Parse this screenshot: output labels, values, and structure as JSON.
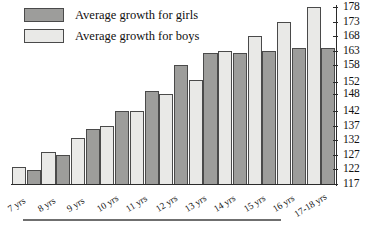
{
  "legend": {
    "position": "top-left",
    "entries": [
      {
        "label": "Average growth for girls",
        "key": "girls",
        "color": "#9d9d9b"
      },
      {
        "label": "Average growth for boys",
        "key": "boys",
        "color": "#e9e9e7"
      }
    ]
  },
  "axis": {
    "y_ticks": [
      "178",
      "173",
      "168",
      "163",
      "158",
      "152",
      "148",
      "142",
      "137",
      "132",
      "127",
      "122",
      "117"
    ],
    "y_min": 117,
    "y_max": 178
  },
  "chart_data": {
    "type": "bar",
    "title": "",
    "subtitle": "",
    "xlabel": "",
    "ylabel": "",
    "ylim": [
      117,
      178
    ],
    "grid": false,
    "legend_position": "top-left",
    "categories": [
      "7 yrs",
      "8 yrs",
      "9 yrs",
      "10 yrs",
      "11 yrs",
      "12 yrs",
      "13 yrs",
      "14 yrs",
      "15 yrs",
      "16 yrs",
      "17-18 yrs"
    ],
    "series": [
      {
        "name": "Average growth for boys",
        "color": "#e9e9e7",
        "values": [
          123,
          128,
          133,
          137,
          142,
          148,
          153,
          163,
          168,
          173,
          178
        ]
      },
      {
        "name": "Average growth for girls",
        "color": "#9d9d9b",
        "values": [
          122,
          127,
          136,
          142,
          149,
          158,
          162,
          162,
          163,
          164,
          164
        ]
      }
    ],
    "series_order_in_group": [
      "boys",
      "girls"
    ],
    "y_tick_labels": [
      "117",
      "122",
      "127",
      "132",
      "137",
      "142",
      "148",
      "152",
      "158",
      "163",
      "168",
      "173",
      "178"
    ]
  }
}
